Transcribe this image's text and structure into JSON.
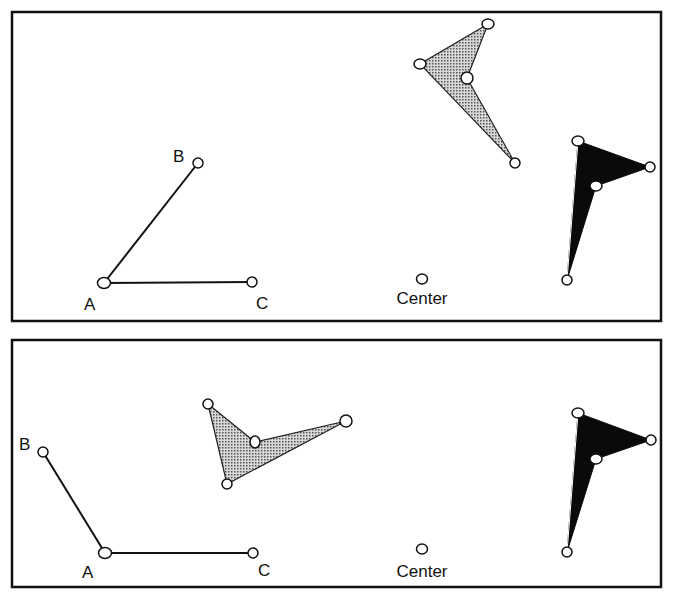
{
  "colors": {
    "ink": "#111111",
    "gray_fill": "#a8a8a8",
    "black_fill": "#0a0a0a",
    "bg": "#ffffff"
  },
  "panels": [
    {
      "name": "top",
      "frame": {
        "x": 12,
        "y": 12,
        "w": 649,
        "h": 309
      },
      "angle": {
        "A": [
          104,
          283
        ],
        "B": [
          198,
          163
        ],
        "C": [
          252,
          282
        ]
      },
      "labels": {
        "A": "A",
        "B": "B",
        "C": "C",
        "center": "Center"
      },
      "center_point": [
        422,
        279
      ],
      "gray_shape": [
        [
          488,
          24
        ],
        [
          420,
          64
        ],
        [
          467,
          78
        ],
        [
          515,
          163
        ]
      ],
      "black_shape": [
        [
          578,
          141
        ],
        [
          650,
          167
        ],
        [
          596,
          186
        ],
        [
          567,
          280
        ]
      ]
    },
    {
      "name": "bottom",
      "frame": {
        "x": 12,
        "y": 340,
        "w": 649,
        "h": 247
      },
      "angle": {
        "A": [
          105,
          553
        ],
        "B": [
          43,
          452
        ],
        "C": [
          253,
          553
        ]
      },
      "labels": {
        "A": "A",
        "B": "B",
        "C": "C",
        "center": "Center"
      },
      "center_point": [
        422,
        549
      ],
      "gray_shape": [
        [
          208,
          404
        ],
        [
          346,
          421
        ],
        [
          255,
          442
        ],
        [
          227,
          484
        ]
      ],
      "black_shape": [
        [
          578,
          413
        ],
        [
          651,
          440
        ],
        [
          596,
          459
        ],
        [
          567,
          552
        ]
      ]
    }
  ]
}
